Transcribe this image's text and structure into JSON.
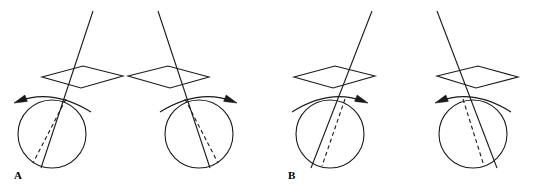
{
  "figure": {
    "title": "",
    "background_color": "#ffffff",
    "stroke_color": "#1a1a1a",
    "width": 535,
    "height": 192,
    "panels": [
      {
        "id": "A",
        "label": "A",
        "label_x": 14,
        "label_y": 170,
        "subfigures": [
          {
            "id": "A1",
            "name": "sphere-plane-axis-left",
            "circle": {
              "cx": 52,
              "cy": 134,
              "r": 34
            },
            "plane": {
              "left_x": 42,
              "left_y": 77,
              "top_x": 83,
              "top_y": 66,
              "right_x": 123,
              "right_y": 76,
              "bottom_x": 81,
              "bottom_y": 88
            },
            "axis_solid": {
              "x1": 93,
              "y1": 11,
              "x2": 41,
              "y2": 168
            },
            "axis_dashed": {
              "x1": 66,
              "y1": 99,
              "x2": 33,
              "y2": 163
            },
            "rotation_arrow": {
              "direction": "counterclockwise",
              "arrow_end": "left",
              "start_x": 91,
              "start_y": 112,
              "ctrl_x": 52,
              "ctrl_y": 88,
              "end_x": 14,
              "end_y": 103
            }
          },
          {
            "id": "A2",
            "name": "sphere-plane-axis-right",
            "circle": {
              "cx": 199,
              "cy": 134,
              "r": 34
            },
            "plane": {
              "left_x": 128,
              "left_y": 76,
              "top_x": 168,
              "top_y": 66,
              "right_x": 209,
              "right_y": 77,
              "bottom_x": 170,
              "bottom_y": 88
            },
            "axis_solid": {
              "x1": 158,
              "y1": 11,
              "x2": 210,
              "y2": 168
            },
            "axis_dashed": {
              "x1": 185,
              "y1": 99,
              "x2": 218,
              "y2": 163
            },
            "rotation_arrow": {
              "direction": "clockwise",
              "arrow_end": "right",
              "start_x": 160,
              "start_y": 112,
              "ctrl_x": 199,
              "ctrl_y": 88,
              "end_x": 237,
              "end_y": 103
            }
          }
        ]
      },
      {
        "id": "B",
        "label": "B",
        "label_x": 288,
        "label_y": 170,
        "subfigures": [
          {
            "id": "B1",
            "name": "sphere-plane-axis-left",
            "circle": {
              "cx": 330,
              "cy": 134,
              "r": 34
            },
            "plane": {
              "left_x": 294,
              "left_y": 77,
              "top_x": 335,
              "top_y": 66,
              "right_x": 375,
              "right_y": 76,
              "bottom_x": 333,
              "bottom_y": 88
            },
            "axis_solid": {
              "x1": 372,
              "y1": 11,
              "x2": 311,
              "y2": 168
            },
            "axis_dashed": {
              "x1": 345,
              "y1": 99,
              "x2": 322,
              "y2": 166
            },
            "rotation_arrow": {
              "direction": "clockwise",
              "arrow_end": "right",
              "start_x": 292,
              "start_y": 112,
              "ctrl_x": 330,
              "ctrl_y": 88,
              "end_x": 368,
              "end_y": 103
            }
          },
          {
            "id": "B2",
            "name": "sphere-plane-axis-right",
            "circle": {
              "cx": 473,
              "cy": 134,
              "r": 34
            },
            "plane": {
              "left_x": 437,
              "left_y": 76,
              "top_x": 478,
              "top_y": 66,
              "right_x": 518,
              "right_y": 77,
              "bottom_x": 476,
              "bottom_y": 88
            },
            "axis_solid": {
              "x1": 437,
              "y1": 11,
              "x2": 497,
              "y2": 168
            },
            "axis_dashed": {
              "x1": 463,
              "y1": 99,
              "x2": 484,
              "y2": 166
            },
            "rotation_arrow": {
              "direction": "counterclockwise",
              "arrow_end": "left",
              "start_x": 511,
              "start_y": 112,
              "ctrl_x": 473,
              "ctrl_y": 88,
              "end_x": 435,
              "end_y": 103
            }
          }
        ]
      }
    ]
  }
}
